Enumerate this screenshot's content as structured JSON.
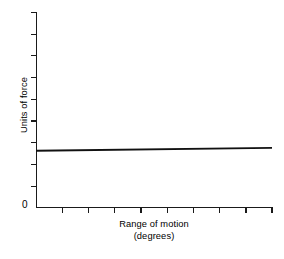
{
  "chart_data": {
    "type": "line",
    "title": "",
    "subtitle": "",
    "xlabel": "Range of motion",
    "xlabel_units": "(degrees)",
    "ylabel": "Units of force",
    "origin_label": "0",
    "grid": false,
    "legend": null,
    "xlim": [
      0,
      9
    ],
    "ylim": [
      0,
      9
    ],
    "x_tick_labels": [],
    "y_tick_labels": [],
    "x_tick_count": 9,
    "y_tick_count": 9,
    "annotations": [],
    "series": [
      {
        "name": "force",
        "x": [
          0,
          9
        ],
        "values": [
          2.62,
          2.75
        ],
        "color": "#111111",
        "style": "solid",
        "description": "near-horizontal line, very slight positive slope"
      }
    ]
  },
  "figure": {
    "background_color": "#ffffff",
    "axis_color": "#1a1a1a"
  }
}
